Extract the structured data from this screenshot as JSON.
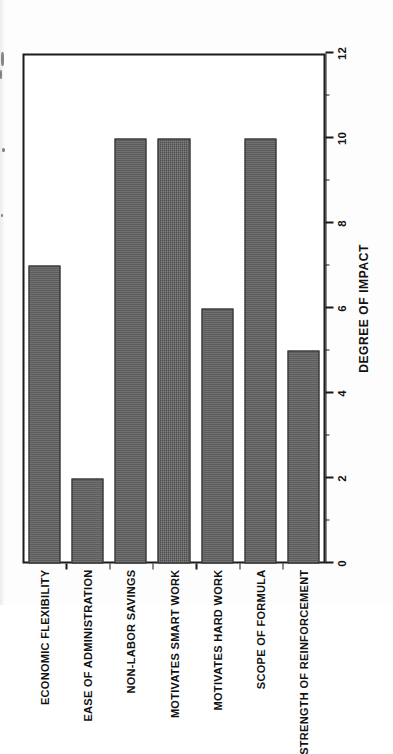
{
  "chart_data": {
    "type": "bar",
    "orientation": "vertical-printed-sideways",
    "title": "",
    "subtitle": "",
    "xlabel": "",
    "ylabel": "DEGREE OF IMPACT",
    "categories": [
      "ECONOMIC FLEXIBILITY",
      "EASE OF ADMINISTRATION",
      "NON-LABOR SAVINGS",
      "MOTIVATES SMART WORK",
      "MOTIVATES HARD WORK",
      "SCOPE OF FORMULA",
      "STRENGTH OF REINFORCEMENT"
    ],
    "values": [
      7,
      2,
      10,
      10,
      6,
      10,
      5
    ],
    "ylim": [
      0,
      12
    ],
    "tick_labels": [
      "0",
      "2",
      "4",
      "6",
      "8",
      "10",
      "12"
    ],
    "tick_values": [
      0,
      2,
      4,
      6,
      8,
      10,
      12
    ],
    "minor_tick_values": [
      1,
      3,
      5,
      7,
      9,
      11
    ],
    "grid": false,
    "legend": null,
    "bar_color": "#5b5b5b",
    "bar_edge_color": "#2e2e2e",
    "axis_color": "#1b1b1b",
    "background": "#ffffff"
  },
  "axis": {
    "value_axis_title": "DEGREE OF IMPACT",
    "tick_0": "0",
    "tick_1": "2",
    "tick_2": "4",
    "tick_3": "6",
    "tick_4": "8",
    "tick_5": "10",
    "tick_6": "12"
  },
  "categories": {
    "cat_0": "ECONOMIC FLEXIBILITY",
    "cat_1": "EASE OF ADMINISTRATION",
    "cat_2": "NON-LABOR SAVINGS",
    "cat_3": "MOTIVATES SMART WORK",
    "cat_4": "MOTIVATES HARD WORK",
    "cat_5": "SCOPE OF FORMULA",
    "cat_6": "STRENGTH OF REINFORCEMENT"
  }
}
